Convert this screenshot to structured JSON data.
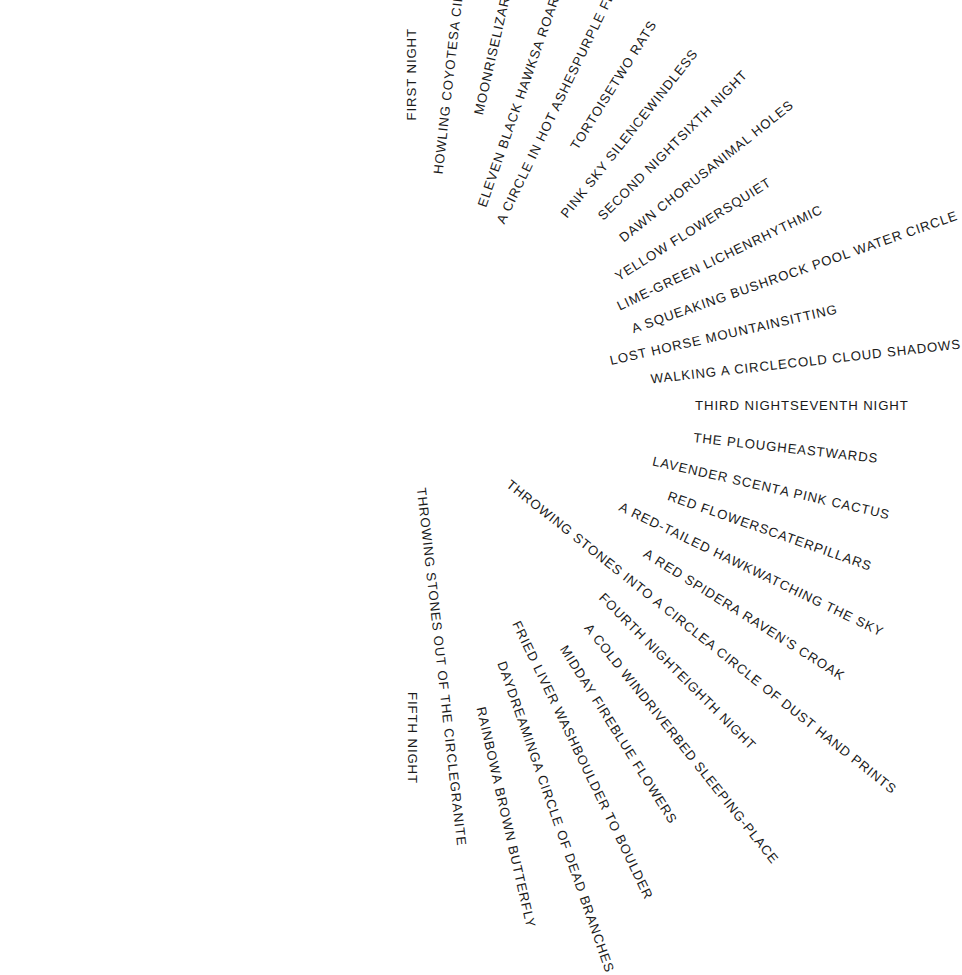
{
  "artwork": {
    "kind": "radial-word-circle",
    "center_x": 412,
    "center_y": 406,
    "outer_radius": 378,
    "text_color": "#1a1a1a",
    "background_color": "#ffffff",
    "start_angle_deg": -90,
    "direction": "clockwise",
    "count": 56
  },
  "labels": [
    {
      "text": "FIRST NIGHT"
    },
    {
      "text": "HOWLING COYOTES"
    },
    {
      "text": "MOONRISE"
    },
    {
      "text": "ELEVEN BLACK HAWKS"
    },
    {
      "text": "A CIRCLE IN HOT ASHES"
    },
    {
      "text": "TORTOISE"
    },
    {
      "text": "PINK SKY SILENCE"
    },
    {
      "text": "SECOND NIGHT"
    },
    {
      "text": "DAWN CHORUS"
    },
    {
      "text": "YELLOW FLOWERS"
    },
    {
      "text": "LIME-GREEN LICHEN"
    },
    {
      "text": "A SQUEAKING BUSH"
    },
    {
      "text": "LOST HORSE MOUNTAIN"
    },
    {
      "text": "WALKING A CIRCLE"
    },
    {
      "text": "THIRD NIGHT"
    },
    {
      "text": "THE PLOUGH"
    },
    {
      "text": "LAVENDER SCENT"
    },
    {
      "text": "RED FLOWERS"
    },
    {
      "text": "A RED-TAILED HAWK"
    },
    {
      "text": "A RED SPIDER"
    },
    {
      "text": "THROWING STONES INTO A CIRCLE"
    },
    {
      "text": "FOURTH NIGHT"
    },
    {
      "text": "A COLD WIND"
    },
    {
      "text": "MIDDAY FIRE"
    },
    {
      "text": "FRIED LIVER WASH"
    },
    {
      "text": "DAYDREAMING"
    },
    {
      "text": "RAINBOW"
    },
    {
      "text": "THROWING STONES OUT OF THE CIRCLE"
    },
    {
      "text": "FIFTH NIGHT"
    },
    {
      "text": "A CIRCLE IN SNOW"
    },
    {
      "text": "LIZARDS"
    },
    {
      "text": "A ROARING WIND"
    },
    {
      "text": "PURPLE FLOWERS"
    },
    {
      "text": "TWO RATS"
    },
    {
      "text": "WINDLESS"
    },
    {
      "text": "SIXTH NIGHT"
    },
    {
      "text": "ANIMAL HOLES"
    },
    {
      "text": "QUIET"
    },
    {
      "text": "RHYTHMIC"
    },
    {
      "text": "ROCK POOL WATER CIRCLE"
    },
    {
      "text": "SITTING"
    },
    {
      "text": "COLD CLOUD SHADOWS"
    },
    {
      "text": "SEVENTH NIGHT"
    },
    {
      "text": "EASTWARDS"
    },
    {
      "text": "A PINK CACTUS"
    },
    {
      "text": "CATERPILLARS"
    },
    {
      "text": "WATCHING THE SKY"
    },
    {
      "text": "A RAVEN'S CROAK"
    },
    {
      "text": "A CIRCLE OF DUST HAND PRINTS"
    },
    {
      "text": "EIGHTH NIGHT"
    },
    {
      "text": "RIVERBED SLEEPING-PLACE"
    },
    {
      "text": "BLUE FLOWERS"
    },
    {
      "text": "BOULDER TO BOULDER"
    },
    {
      "text": "A CIRCLE OF DEAD BRANCHES"
    },
    {
      "text": "A BROWN BUTTERFLY"
    },
    {
      "text": "GRANITE"
    }
  ]
}
